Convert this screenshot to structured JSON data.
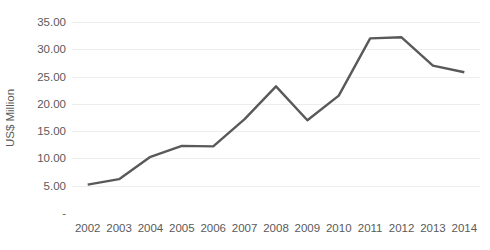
{
  "chart_data": {
    "type": "line",
    "title": "",
    "subtitle": "",
    "xlabel": "",
    "ylabel": "US$ Million",
    "x": [
      "2002",
      "2003",
      "2004",
      "2005",
      "2006",
      "2007",
      "2008",
      "2009",
      "2010",
      "2011",
      "2012",
      "2013",
      "2014"
    ],
    "categories": [
      "2002",
      "2003",
      "2004",
      "2005",
      "2006",
      "2007",
      "2008",
      "2009",
      "2010",
      "2011",
      "2012",
      "2013",
      "2014"
    ],
    "values": [
      5.2,
      6.2,
      10.3,
      12.3,
      12.2,
      17.2,
      23.2,
      17.0,
      21.5,
      32.0,
      32.2,
      27.0,
      25.8
    ],
    "series": [
      {
        "name": "US$ Million",
        "values": [
          5.2,
          6.2,
          10.3,
          12.3,
          12.2,
          17.2,
          23.2,
          17.0,
          21.5,
          32.0,
          32.2,
          27.0,
          25.8
        ]
      }
    ],
    "ylim": [
      0,
      35
    ],
    "yticks": [
      0,
      5,
      10,
      15,
      20,
      25,
      30,
      35
    ],
    "ytick_labels": [
      "-",
      "5.00",
      "10.00",
      "15.00",
      "20.00",
      "25.00",
      "30.00",
      "35.00"
    ],
    "grid": "horizontal",
    "legend": "none",
    "line_color": "#595959",
    "grid_color": "#ededed",
    "text_color": "#5a5a5a",
    "background": "#ffffff",
    "markers": false,
    "line_width": 2.4
  }
}
